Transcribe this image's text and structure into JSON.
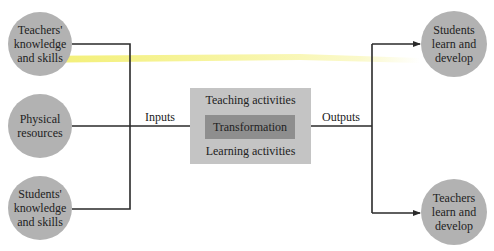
{
  "diagram": {
    "inputs": [
      {
        "id": "teachers-knowledge",
        "label": "Teachers'\nknowledge\nand skills"
      },
      {
        "id": "physical-resources",
        "label": "Physical\nresources"
      },
      {
        "id": "students-knowledge",
        "label": "Students'\nknowledge\nand skills"
      }
    ],
    "inputs_label": "Inputs",
    "process": {
      "top_label": "Teaching activities",
      "core_label": "Transformation",
      "bottom_label": "Learning activities"
    },
    "outputs_label": "Outputs",
    "outputs": [
      {
        "id": "students-develop",
        "label": "Students\nlearn and\ndevelop"
      },
      {
        "id": "teachers-develop",
        "label": "Teachers\nlearn and\ndevelop"
      }
    ],
    "colors": {
      "circle": "#b2b2b2",
      "outer_box": "#c4c4c4",
      "inner_box": "#8e8e8e",
      "line": "#2a2a2a",
      "highlight": "#f2ee6a"
    }
  }
}
